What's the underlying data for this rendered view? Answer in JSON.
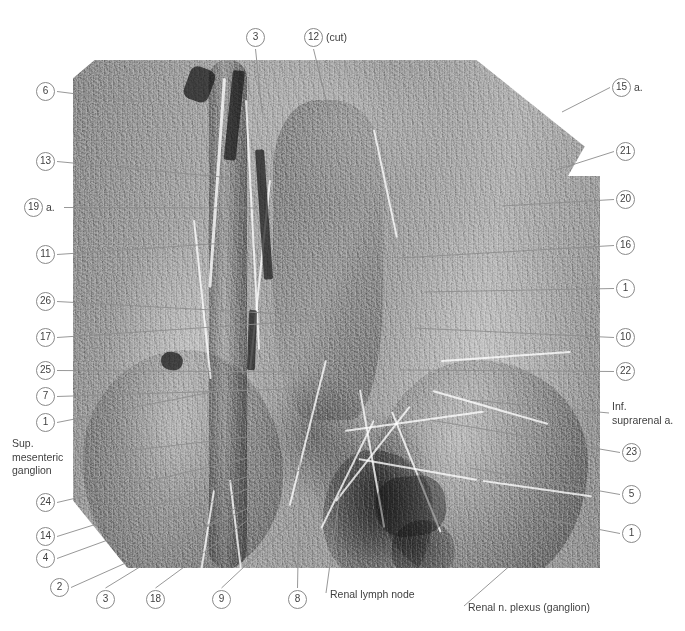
{
  "figure": {
    "kind": "anatomical-dissection-photograph",
    "plate": {
      "left": 73,
      "top": 60,
      "width": 527,
      "height": 508
    }
  },
  "labels": {
    "left": [
      {
        "id": "label-6",
        "number": "6",
        "suffix": "",
        "x": 36,
        "y": 82,
        "tip_x": 140,
        "tip_y": 102
      },
      {
        "id": "label-13",
        "number": "13",
        "suffix": "",
        "x": 36,
        "y": 152,
        "tip_x": 232,
        "tip_y": 178
      },
      {
        "id": "label-19",
        "number": "19",
        "suffix": "a.",
        "x": 24,
        "y": 198,
        "tip_x": 258,
        "tip_y": 208
      },
      {
        "id": "label-11",
        "number": "11",
        "suffix": "",
        "x": 36,
        "y": 245,
        "tip_x": 226,
        "tip_y": 243
      },
      {
        "id": "label-26",
        "number": "26",
        "suffix": "",
        "x": 36,
        "y": 292,
        "tip_x": 320,
        "tip_y": 316
      },
      {
        "id": "label-17",
        "number": "17",
        "suffix": "",
        "x": 36,
        "y": 328,
        "tip_x": 318,
        "tip_y": 320
      },
      {
        "id": "label-25",
        "number": "25",
        "suffix": "",
        "x": 36,
        "y": 361,
        "tip_x": 300,
        "tip_y": 372
      },
      {
        "id": "label-7",
        "number": "7",
        "suffix": "",
        "x": 36,
        "y": 387,
        "tip_x": 318,
        "tip_y": 388
      },
      {
        "id": "label-1L",
        "number": "1",
        "suffix": "",
        "x": 36,
        "y": 413,
        "tip_x": 222,
        "tip_y": 390
      },
      {
        "id": "label-24",
        "number": "24",
        "suffix": "",
        "x": 36,
        "y": 493,
        "tip_x": 282,
        "tip_y": 450
      },
      {
        "id": "label-14",
        "number": "14",
        "suffix": "",
        "x": 36,
        "y": 527,
        "tip_x": 300,
        "tip_y": 460
      },
      {
        "id": "label-4",
        "number": "4",
        "suffix": "",
        "x": 36,
        "y": 549,
        "tip_x": 300,
        "tip_y": 470
      },
      {
        "id": "label-2",
        "number": "2",
        "suffix": "",
        "x": 50,
        "y": 578,
        "tip_x": 262,
        "tip_y": 502
      }
    ],
    "left_text": [
      {
        "id": "sup-mesenteric-ganglion",
        "lines": [
          "Sup.",
          "mesenteric",
          "ganglion"
        ],
        "x": 12,
        "y": 437,
        "tip_x": 290,
        "tip_y": 432
      }
    ],
    "top": [
      {
        "id": "label-3T",
        "number": "3",
        "suffix": "",
        "x": 246,
        "y": 28,
        "tip_x": 262,
        "tip_y": 112
      },
      {
        "id": "label-12",
        "number": "12",
        "suffix": "(cut)",
        "x": 304,
        "y": 28,
        "tip_x": 330,
        "tip_y": 116
      }
    ],
    "right": [
      {
        "id": "label-15",
        "number": "15",
        "suffix": "a.",
        "x": 612,
        "y": 78,
        "tip_x": 562,
        "tip_y": 112
      },
      {
        "id": "label-21",
        "number": "21",
        "suffix": "",
        "x": 616,
        "y": 142,
        "tip_x": 556,
        "tip_y": 170
      },
      {
        "id": "label-20",
        "number": "20",
        "suffix": "",
        "x": 616,
        "y": 190,
        "tip_x": 502,
        "tip_y": 206
      },
      {
        "id": "label-16",
        "number": "16",
        "suffix": "",
        "x": 616,
        "y": 236,
        "tip_x": 400,
        "tip_y": 258
      },
      {
        "id": "label-1R",
        "number": "1",
        "suffix": "",
        "x": 616,
        "y": 279,
        "tip_x": 424,
        "tip_y": 292
      },
      {
        "id": "label-10",
        "number": "10",
        "suffix": "",
        "x": 616,
        "y": 328,
        "tip_x": 414,
        "tip_y": 328
      },
      {
        "id": "label-22",
        "number": "22",
        "suffix": "",
        "x": 616,
        "y": 362,
        "tip_x": 400,
        "tip_y": 370
      },
      {
        "id": "label-23",
        "number": "23",
        "suffix": "",
        "x": 622,
        "y": 443,
        "tip_x": 430,
        "tip_y": 420
      },
      {
        "id": "label-5",
        "number": "5",
        "suffix": "",
        "x": 622,
        "y": 485,
        "tip_x": 470,
        "tip_y": 468
      },
      {
        "id": "label-1R2",
        "number": "1",
        "suffix": "",
        "x": 622,
        "y": 524,
        "tip_x": 540,
        "tip_y": 518
      }
    ],
    "right_text": [
      {
        "id": "inf-suprarenal-a",
        "lines": [
          "Inf.",
          "suprarenal a."
        ],
        "x": 612,
        "y": 400,
        "tip_x": 470,
        "tip_y": 400
      }
    ],
    "bottom": [
      {
        "id": "label-3B",
        "number": "3",
        "suffix": "",
        "x": 96,
        "y": 590,
        "tip_x": 236,
        "tip_y": 508
      },
      {
        "id": "label-18",
        "number": "18",
        "suffix": "",
        "x": 146,
        "y": 590,
        "tip_x": 248,
        "tip_y": 520
      },
      {
        "id": "label-9",
        "number": "9",
        "suffix": "",
        "x": 212,
        "y": 590,
        "tip_x": 294,
        "tip_y": 520
      },
      {
        "id": "label-8",
        "number": "8",
        "suffix": "",
        "x": 288,
        "y": 590,
        "tip_x": 300,
        "tip_y": 455
      }
    ],
    "bottom_text": [
      {
        "id": "renal-lymph-node",
        "text": "Renal lymph node",
        "x": 330,
        "y": 588,
        "tip_x": 340,
        "tip_y": 492
      },
      {
        "id": "renal-n-plexus",
        "text": "Renal n. plexus (ganglion)",
        "x": 468,
        "y": 601,
        "tip_x": 562,
        "tip_y": 520
      }
    ]
  },
  "colors": {
    "leader_line": "#8c8c8c",
    "circle_stroke": "#8a8a8a",
    "text": "#3f3f3f",
    "background": "#ffffff"
  }
}
